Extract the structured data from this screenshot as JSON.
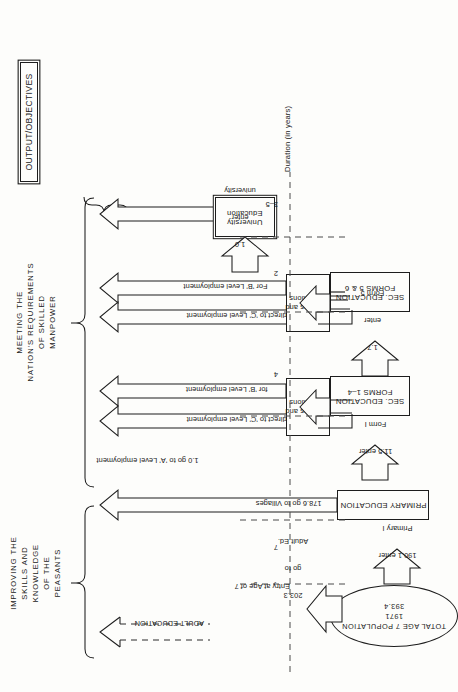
{
  "diagram": {
    "header_label": "OUTPUT/OBJECTIVES",
    "axis_title": "Duration (in years)",
    "entry_note": "Entry at Age of 7",
    "duration_ticks": [
      "3–5",
      "2",
      "4",
      "7"
    ],
    "objectives": [
      {
        "id": "skilled-manpower",
        "lines": [
          "MEETING THE",
          "NATION'S REQUIREMENTS",
          "OF SKILLED",
          "MANPOWER"
        ]
      },
      {
        "id": "peasants",
        "lines": [
          "IMPROVING THE",
          "SKILLS AND",
          "KNOWLEDGE",
          "OF THE",
          "PEASANTS"
        ]
      }
    ],
    "stage_boxes": [
      {
        "id": "university-education",
        "lines": [
          "University",
          "Education"
        ]
      },
      {
        "id": "sec-education-5-6",
        "lines": [
          "SEC. EDUCATION",
          "FORMS 5 & 6"
        ]
      },
      {
        "id": "sec-education-1-4",
        "lines": [
          "SEC. EDUCATION",
          "FORMS 1–4"
        ]
      },
      {
        "id": "primary-education",
        "lines": [
          "PRIMARY EDUCATION"
        ]
      },
      {
        "id": "colleges-upper",
        "lines": [
          "Colleges and",
          "Institutions"
        ]
      },
      {
        "id": "colleges-lower",
        "lines": [
          "Colleges and",
          "Institutions"
        ]
      },
      {
        "id": "adult-education",
        "lines": [
          "ADULT EDUCATION"
        ]
      }
    ],
    "population_ellipse": {
      "lines": [
        "TOTAL AGE 7 POPULATION",
        "1971",
        "393.4"
      ]
    },
    "flow_labels": [
      {
        "id": "to-a-level",
        "text": "1.0 go to 'A' Level employment"
      },
      {
        "id": "enter-university",
        "lines": [
          "1.0",
          "enter",
          "university"
        ]
      },
      {
        "id": "to-preservice-1",
        "text": "0.3 to Pre-service"
      },
      {
        "id": "direct-c-level-1",
        "text": "0.4 go direct to 'C' Level employment"
      },
      {
        "id": "for-b-level-1",
        "text": "For 'B' Level employment"
      },
      {
        "id": "enter-form-5",
        "lines": [
          "1.7",
          "enter",
          "Form 5"
        ]
      },
      {
        "id": "to-preservice-2",
        "text": "3.8 go to Pre-service"
      },
      {
        "id": "direct-c-level-2",
        "text": "6.0 go direct to 'C' Level employment"
      },
      {
        "id": "for-b-level-2",
        "text": "for 'B' Level employment"
      },
      {
        "id": "enter-form-1",
        "lines": [
          "11.5 enter",
          "Form I"
        ]
      },
      {
        "id": "go-to-villages",
        "text": "178.6 go to Villages"
      },
      {
        "id": "enter-primary-1",
        "lines": [
          "190.1 enter",
          "Primary I"
        ]
      },
      {
        "id": "go-to-adult-ed",
        "lines": [
          "203.3",
          "go to",
          "Adult Ed."
        ]
      }
    ]
  }
}
